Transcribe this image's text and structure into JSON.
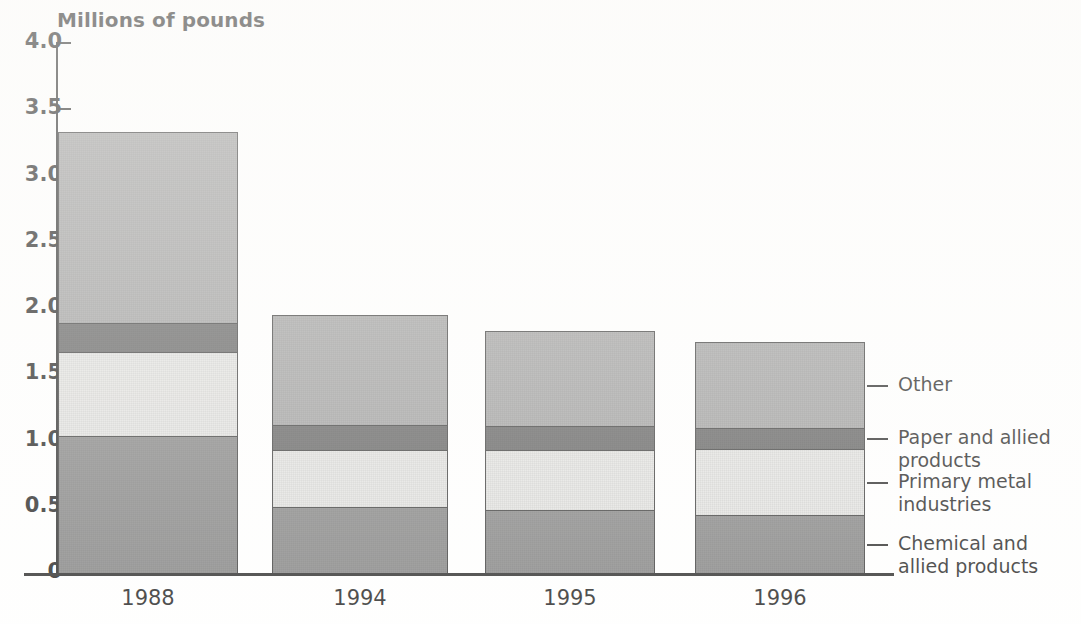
{
  "chart_data": {
    "type": "bar",
    "subtype": "stacked-vertical",
    "title": "",
    "ylabel": "Millions of pounds",
    "xlabel": "",
    "ylim": [
      0,
      4.0
    ],
    "yticks": [
      "0",
      "0.5",
      "1.0",
      "1.5",
      "2.0",
      "2.5",
      "3.0",
      "3.5",
      "4.0"
    ],
    "ytick_values": [
      0,
      0.5,
      1.0,
      1.5,
      2.0,
      2.5,
      3.0,
      3.5,
      4.0
    ],
    "grid": false,
    "legend_position": "right",
    "categories": [
      "1988",
      "1994",
      "1995",
      "1996"
    ],
    "series": [
      {
        "name": "Chemical and allied products",
        "color": "#7e7e7e",
        "values": [
          1.04,
          0.5,
          0.48,
          0.44
        ]
      },
      {
        "name": "Primary metal industries",
        "color": "#e2e2e0",
        "values": [
          0.63,
          0.43,
          0.45,
          0.5
        ]
      },
      {
        "name": "Paper and allied products",
        "color": "#585858",
        "values": [
          0.22,
          0.19,
          0.18,
          0.16
        ]
      },
      {
        "name": "Other",
        "color": "#9d9d9d",
        "values": [
          1.44,
          0.83,
          0.72,
          0.64
        ]
      }
    ],
    "totals": [
      3.33,
      1.95,
      1.83,
      1.74
    ],
    "cumulative_tops": [
      [
        1.04,
        1.67,
        1.89,
        3.33
      ],
      [
        0.5,
        0.93,
        1.12,
        1.95
      ],
      [
        0.48,
        0.93,
        1.11,
        1.83
      ],
      [
        0.44,
        0.94,
        1.1,
        1.74
      ]
    ]
  },
  "axis": {
    "y_title": "Millions of pounds",
    "y_ticks": [
      "4.0",
      "3.5",
      "3.0",
      "2.5",
      "2.0",
      "1.5",
      "1.0",
      "0.5",
      "0"
    ],
    "x_ticks": [
      "1988",
      "1994",
      "1995",
      "1996"
    ]
  },
  "legend": {
    "items": [
      {
        "label": "Other",
        "color": "#9d9d9d"
      },
      {
        "label": "Paper and allied\nproducts",
        "color": "#585858"
      },
      {
        "label": "Primary metal\nindustries",
        "color": "#e2e2e0"
      },
      {
        "label": "Chemical and\nallied products",
        "color": "#7e7e7e"
      }
    ]
  },
  "colors": {
    "other": "#9d9d9d",
    "paper": "#585858",
    "primary_metal": "#e2e2e0",
    "chemical": "#7e7e7e",
    "axis": "#1a1a1a",
    "text": "#111111",
    "background": "#ffffff"
  }
}
